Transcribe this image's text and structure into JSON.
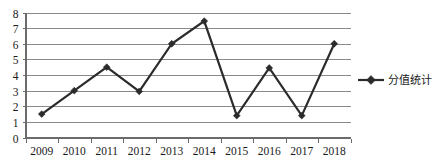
{
  "chart_data": {
    "type": "line",
    "title": "",
    "xlabel": "",
    "ylabel": "",
    "categories": [
      "2009",
      "2010",
      "2011",
      "2012",
      "2013",
      "2014",
      "2015",
      "2016",
      "2017",
      "2018"
    ],
    "series": [
      {
        "name": "分值统计",
        "values": [
          1.5,
          3.0,
          4.5,
          2.95,
          6.0,
          7.45,
          1.4,
          4.45,
          1.4,
          6.0
        ],
        "color": "#2b2b2b",
        "marker": "diamond"
      }
    ],
    "ylim": [
      0,
      8
    ],
    "yticks": [
      0,
      1,
      2,
      3,
      4,
      5,
      6,
      7,
      8
    ],
    "ytick_labels": [
      "0",
      "1",
      "2",
      "3",
      "4",
      "5",
      "6",
      "7",
      "8"
    ],
    "grid": true,
    "grid_axis": "y",
    "legend": {
      "position": "right",
      "entries": [
        {
          "label": "分值统计",
          "marker": "diamond-line",
          "color": "#2b2b2b"
        }
      ]
    },
    "axis_colors": {
      "gridline": "#8a8a8a",
      "axis": "#6b6b6b",
      "text": "#1a1a1a",
      "background": "#ffffff"
    }
  },
  "legend_entry": {
    "label": "分值统计"
  }
}
